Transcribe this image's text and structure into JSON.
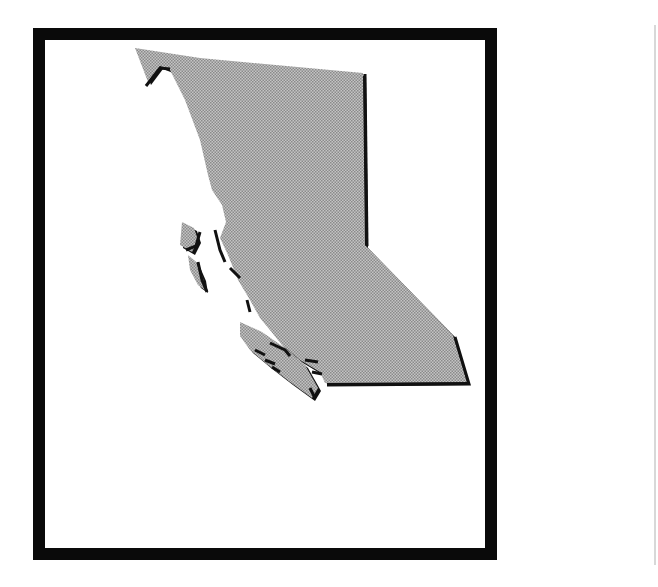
{
  "map": {
    "subject": "British Columbia province silhouette",
    "fill_color": "#b4b4b4",
    "shadow_color": "#111111",
    "frame_color": "#0a0a0a",
    "background": "#ffffff"
  }
}
